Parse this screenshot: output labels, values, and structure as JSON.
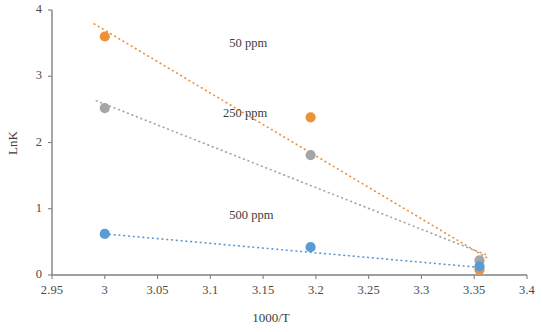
{
  "chart_data": {
    "type": "scatter",
    "title": "",
    "xlabel": "1000/T",
    "ylabel": "LnK",
    "xlim": [
      2.95,
      3.4
    ],
    "ylim": [
      0,
      4
    ],
    "xticks": [
      "2.95",
      "3",
      "3.05",
      "3.1",
      "3.15",
      "3.2",
      "3.25",
      "3.3",
      "3.35",
      "3.4"
    ],
    "xtick_values": [
      2.95,
      3.0,
      3.05,
      3.1,
      3.15,
      3.2,
      3.25,
      3.3,
      3.35,
      3.4
    ],
    "yticks": [
      "0",
      "1",
      "2",
      "3",
      "4"
    ],
    "ytick_values": [
      0,
      1,
      2,
      3,
      4
    ],
    "grid": false,
    "legend": "inline-annotations",
    "series": [
      {
        "name": "50 ppm",
        "color": "#ed9038",
        "x": [
          3.0,
          3.195,
          3.355
        ],
        "values": [
          3.6,
          2.38,
          0.08
        ],
        "trendline": {
          "x0": 2.99,
          "y0": 3.79,
          "x1": 3.362,
          "y1": 0.26
        }
      },
      {
        "name": "250 ppm",
        "color": "#a5a5a5",
        "x": [
          3.0,
          3.195,
          3.355
        ],
        "values": [
          2.52,
          1.81,
          0.22
        ],
        "trendline": {
          "x0": 2.992,
          "y0": 2.63,
          "x1": 3.362,
          "y1": 0.3
        }
      },
      {
        "name": "500 ppm",
        "color": "#5b9bd5",
        "x": [
          3.0,
          3.195,
          3.355
        ],
        "values": [
          0.62,
          0.42,
          0.13
        ],
        "trendline": {
          "x0": 3.0,
          "y0": 0.62,
          "x1": 3.358,
          "y1": 0.11
        }
      }
    ],
    "annotations": [
      {
        "text": "50 ppm",
        "x": 3.118,
        "y": 3.49
      },
      {
        "text": "250 ppm",
        "x": 3.112,
        "y": 2.43
      },
      {
        "text": "500 ppm",
        "x": 3.118,
        "y": 0.89
      }
    ]
  },
  "axes": {
    "y_axis_title": "LnK",
    "x_axis_title": "1000/T"
  },
  "colors": {
    "series_50": "#ed9038",
    "series_250": "#a5a5a5",
    "series_500": "#5b9bd5",
    "axis": "#808080",
    "text": "#3f3f3f",
    "background": "#ffffff"
  }
}
